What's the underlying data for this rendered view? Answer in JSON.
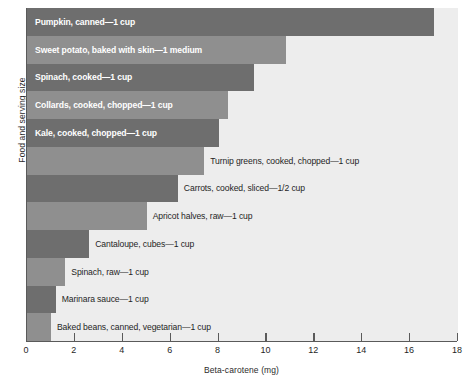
{
  "chart_data": {
    "type": "bar",
    "orientation": "horizontal",
    "title": "",
    "xlabel": "Beta-carotene (mg)",
    "ylabel": "Food and serving size",
    "xlim": [
      0,
      18
    ],
    "xticks": [
      0,
      2,
      4,
      6,
      8,
      10,
      12,
      14,
      16,
      18
    ],
    "grid": false,
    "legend": "none",
    "categories": [
      "Pumpkin, canned—1 cup",
      "Sweet potato, baked with skin—1 medium",
      "Spinach, cooked—1 cup",
      "Collards, cooked, chopped—1 cup",
      "Kale, cooked, chopped—1 cup",
      "Turnip greens, cooked, chopped—1 cup",
      "Carrots, cooked, sliced—1/2 cup",
      "Apricot halves, raw—1 cup",
      "Cantaloupe, cubes—1 cup",
      "Spinach, raw—1 cup",
      "Marinara sauce—1 cup",
      "Baked beans, canned, vegetarian—1 cup"
    ],
    "values": [
      17.0,
      10.8,
      9.5,
      8.4,
      8.0,
      7.4,
      6.3,
      5.0,
      2.6,
      1.6,
      1.2,
      1.0
    ],
    "bars": [
      {
        "label": "Pumpkin, canned—1 cup",
        "value": 17.0,
        "shade": "dark",
        "label_position": "inside"
      },
      {
        "label": "Sweet potato, baked with skin—1 medium",
        "value": 10.8,
        "shade": "light",
        "label_position": "inside"
      },
      {
        "label": "Spinach, cooked—1 cup",
        "value": 9.5,
        "shade": "dark",
        "label_position": "inside"
      },
      {
        "label": "Collards, cooked, chopped—1 cup",
        "value": 8.4,
        "shade": "light",
        "label_position": "inside"
      },
      {
        "label": "Kale, cooked, chopped—1 cup",
        "value": 8.0,
        "shade": "dark",
        "label_position": "inside"
      },
      {
        "label": "Turnip greens, cooked, chopped—1 cup",
        "value": 7.4,
        "shade": "light",
        "label_position": "outside"
      },
      {
        "label": "Carrots, cooked, sliced—1/2 cup",
        "value": 6.3,
        "shade": "dark",
        "label_position": "outside"
      },
      {
        "label": "Apricot halves, raw—1 cup",
        "value": 5.0,
        "shade": "light",
        "label_position": "outside"
      },
      {
        "label": "Cantaloupe, cubes—1 cup",
        "value": 2.6,
        "shade": "dark",
        "label_position": "outside"
      },
      {
        "label": "Spinach, raw—1 cup",
        "value": 1.6,
        "shade": "light",
        "label_position": "outside"
      },
      {
        "label": "Marinara sauce—1 cup",
        "value": 1.2,
        "shade": "dark",
        "label_position": "outside"
      },
      {
        "label": "Baked beans, canned, vegetarian—1 cup",
        "value": 1.0,
        "shade": "light",
        "label_position": "outside"
      }
    ]
  },
  "colors": {
    "bar_dark": "#6e6e6e",
    "bar_light": "#8f8f8f",
    "plot_background": "#ededed",
    "axis": "#5a5a5a",
    "inside_label": "#ffffff",
    "outside_label": "#1f1f1f"
  }
}
